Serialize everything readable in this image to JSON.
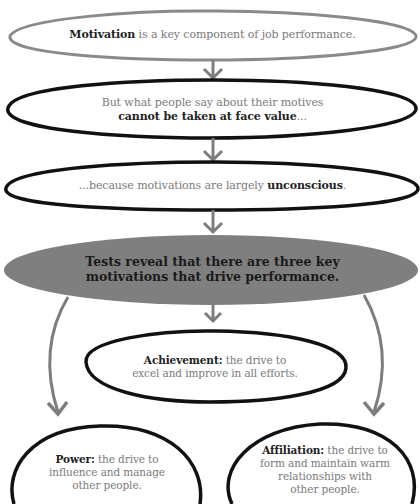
{
  "diagram": {
    "type": "flowchart",
    "colors": {
      "arrow": "#7d7d7d",
      "first_outline": "#8a8a8a",
      "outline": "#111111",
      "highlight_fill": "#7f7f7f",
      "text_regular": "#7a7a7a",
      "text_bold": "#222222"
    },
    "nodes": [
      {
        "id": "motivation",
        "bold": "Motivation",
        "text": " is a key component of job performance."
      },
      {
        "id": "face-value",
        "line1": "But what people say about their motives",
        "bold": "cannot be taken at face value",
        "suffix": "..."
      },
      {
        "id": "unconscious",
        "prefix": "...because motivations are largely ",
        "bold": "unconscious",
        "suffix": "."
      },
      {
        "id": "three-motivations",
        "line1": "Tests reveal that there are three key",
        "line2": "motivations that drive performance."
      },
      {
        "id": "achievement",
        "bold": "Achievement:",
        "line1": " the drive to",
        "line2": "excel and improve in all efforts."
      },
      {
        "id": "power",
        "bold": "Power:",
        "line1": " the drive to",
        "line2": "influence and manage",
        "line3": "other people."
      },
      {
        "id": "affiliation",
        "bold": "Affiliation:",
        "line1": " the drive to",
        "line2": "form and maintain warm",
        "line3": "relationships with",
        "line4": "other people."
      }
    ],
    "edges": [
      {
        "from": "motivation",
        "to": "face-value"
      },
      {
        "from": "face-value",
        "to": "unconscious"
      },
      {
        "from": "unconscious",
        "to": "three-motivations"
      },
      {
        "from": "three-motivations",
        "to": "achievement"
      },
      {
        "from": "three-motivations",
        "to": "power"
      },
      {
        "from": "three-motivations",
        "to": "affiliation"
      }
    ]
  }
}
